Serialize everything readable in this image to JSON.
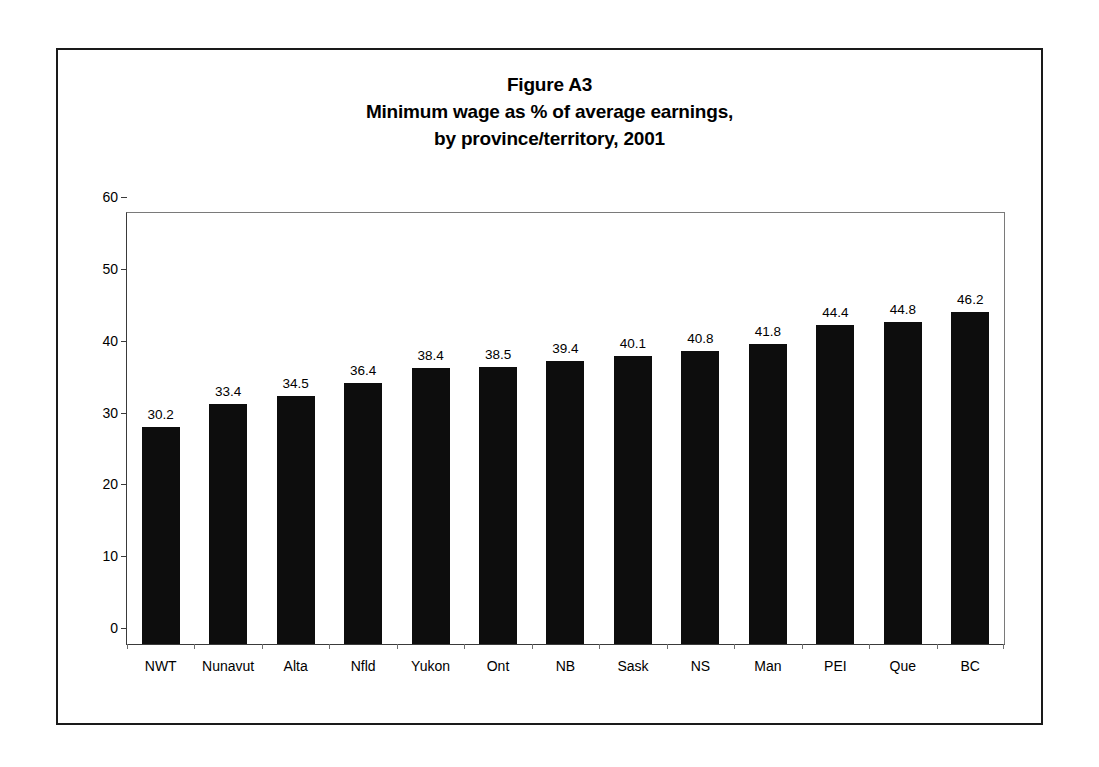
{
  "figure": {
    "title_line1": "Figure A3",
    "title_line2": "Minimum wage as % of average earnings,",
    "title_line3": "by province/territory, 2001"
  },
  "chart_data": {
    "type": "bar",
    "xlabel": "",
    "ylabel": "",
    "ylim": [
      0,
      60
    ],
    "yticks": [
      0,
      10,
      20,
      30,
      40,
      50,
      60
    ],
    "grid": false,
    "legend": false,
    "bar_color": "#0d0d0d",
    "categories": [
      "NWT",
      "Nunavut",
      "Alta",
      "Nfld",
      "Yukon",
      "Ont",
      "NB",
      "Sask",
      "NS",
      "Man",
      "PEI",
      "Que",
      "BC"
    ],
    "values": [
      30.2,
      33.4,
      34.5,
      36.4,
      38.4,
      38.5,
      39.4,
      40.1,
      40.8,
      41.8,
      44.4,
      44.8,
      46.2
    ],
    "value_labels": [
      "30.2",
      "33.4",
      "34.5",
      "36.4",
      "38.4",
      "38.5",
      "39.4",
      "40.1",
      "40.8",
      "41.8",
      "44.4",
      "44.8",
      "46.2"
    ],
    "ytick_labels": [
      "0",
      "10",
      "20",
      "30",
      "40",
      "50",
      "60"
    ]
  }
}
